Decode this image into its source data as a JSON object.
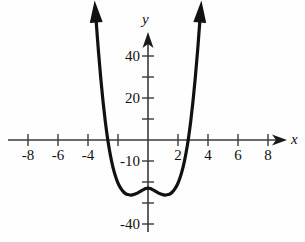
{
  "figure": {
    "name": "quartic-function-graph",
    "background_color": "#fefefe",
    "curve_color": "#111111",
    "axis_color": "#333333"
  },
  "axes": {
    "x_axis_label": "x",
    "y_axis_label": "y",
    "x_label_position": {
      "x": 290,
      "y": 133
    },
    "y_label_position": {
      "x": 141,
      "y": 13
    },
    "origin_px": {
      "x": 148,
      "y": 140
    },
    "x_scale_px_per_unit": 15.0,
    "y_scale_px_per_unit": 2.1,
    "x_axis_line": {
      "x1": 8,
      "y1": 140,
      "x2": 286,
      "y2": 140
    },
    "y_axis_line": {
      "x1": 148,
      "y1": 232,
      "x2": 148,
      "y2": 33
    },
    "x_tick_labels": [
      "-8",
      "-6",
      "-4",
      "2",
      "4",
      "6",
      "8"
    ],
    "x_tick_values": [
      -8,
      -6,
      -4,
      2,
      4,
      6,
      8
    ],
    "x_ticks_all": [
      -8,
      -7,
      -6,
      -5,
      -4,
      -3,
      -2,
      -1,
      1,
      2,
      3,
      4,
      5,
      6,
      7,
      8
    ],
    "y_tick_labels": [
      "40",
      "20",
      "-10",
      "-40"
    ],
    "y_tick_values": [
      40,
      20,
      -10,
      -40
    ],
    "y_ticks_all": [
      40,
      30,
      20,
      10,
      -10,
      -20,
      -30,
      -40
    ],
    "grid": false,
    "arrowheads": [
      "x-positive",
      "y-positive"
    ]
  },
  "chart_data": {
    "type": "line",
    "title": "",
    "xlabel": "x",
    "ylabel": "y",
    "xlim": [
      -9.3,
      9.2
    ],
    "ylim": [
      -52,
      51
    ],
    "grid": false,
    "legend": "none",
    "series": [
      {
        "name": "quartic",
        "description": "W-shaped quartic curve with two minima, a local maximum at x=0, and arrowheads on both ends pointing upward",
        "x": [
          -3.45,
          -3.3,
          -3.15,
          -3.0,
          -2.85,
          -2.7,
          -2.55,
          -2.4,
          -2.25,
          -2.1,
          -1.95,
          -1.8,
          -1.65,
          -1.5,
          -1.35,
          -1.2,
          -1.05,
          -0.9,
          -0.75,
          -0.6,
          -0.45,
          -0.3,
          -0.15,
          0.0,
          0.15,
          0.3,
          0.45,
          0.6,
          0.75,
          0.9,
          1.05,
          1.2,
          1.35,
          1.5,
          1.65,
          1.8,
          1.95,
          2.1,
          2.25,
          2.4,
          2.55,
          2.7,
          2.85,
          3.0,
          3.15,
          3.3,
          3.45
        ],
        "y": [
          56.0,
          42.0,
          29.5,
          18.5,
          9.0,
          1.0,
          -5.6,
          -11.0,
          -15.3,
          -18.7,
          -21.3,
          -23.2,
          -24.6,
          -25.5,
          -26.0,
          -26.2,
          -26.1,
          -25.8,
          -25.4,
          -24.8,
          -24.2,
          -23.6,
          -23.1,
          -22.9,
          -23.1,
          -23.6,
          -24.2,
          -24.8,
          -25.4,
          -25.8,
          -26.1,
          -26.2,
          -26.0,
          -25.5,
          -24.6,
          -23.2,
          -21.3,
          -18.7,
          -15.3,
          -11.0,
          -5.6,
          1.0,
          9.0,
          18.5,
          29.5,
          42.0,
          56.0
        ]
      }
    ],
    "features": {
      "x_intercepts": [
        -2.68,
        2.68
      ],
      "local_maximum": {
        "x": 0,
        "y": -22.9
      },
      "local_minima": [
        {
          "x": -1.2,
          "y": -26.2
        },
        {
          "x": 1.2,
          "y": -26.2
        }
      ],
      "y_intercept": -22.9,
      "end_behavior": "both branches rise to +infinity"
    }
  }
}
